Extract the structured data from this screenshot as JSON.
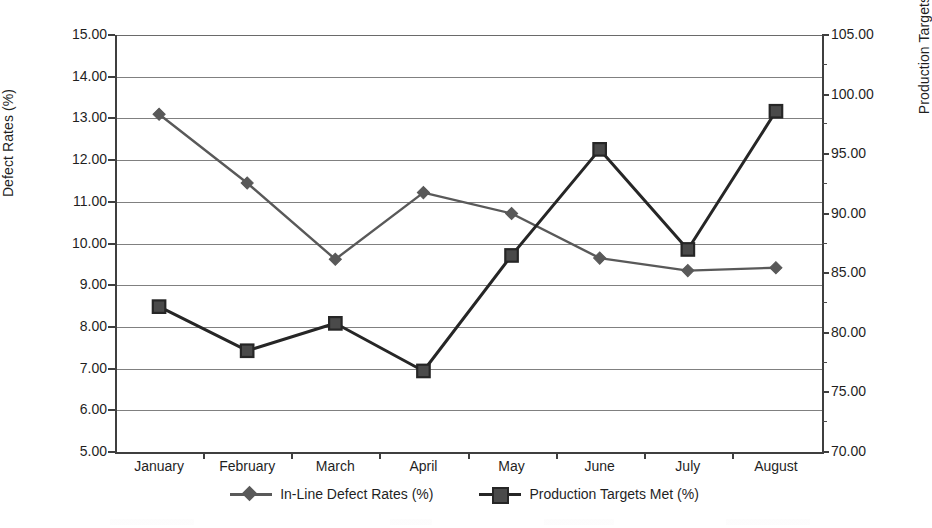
{
  "chart_data": {
    "type": "line",
    "title": "",
    "xlabel": "",
    "categories": [
      "January",
      "February",
      "March",
      "April",
      "May",
      "June",
      "July",
      "August"
    ],
    "grid": true,
    "legend_position": "bottom",
    "series": [
      {
        "name": "In-Line Defect Rates (%)",
        "axis": "left",
        "marker": "diamond",
        "color": "#595959",
        "values": [
          13.1,
          11.45,
          9.62,
          11.22,
          10.72,
          9.65,
          9.35,
          9.42
        ]
      },
      {
        "name": "Production Targets Met (%)",
        "axis": "right",
        "marker": "square",
        "color": "#262626",
        "values": [
          82.2,
          78.5,
          80.8,
          76.8,
          86.5,
          95.4,
          87.0,
          98.6
        ]
      }
    ],
    "axes": {
      "left": {
        "label": "Defect Rates (%)",
        "min": 5.0,
        "max": 15.0,
        "step": 1.0,
        "ticks": [
          "5.00",
          "6.00",
          "7.00",
          "8.00",
          "9.00",
          "10.00",
          "11.00",
          "12.00",
          "13.00",
          "14.00",
          "15.00"
        ]
      },
      "right": {
        "label": "Production Targets (%)",
        "min": 70.0,
        "max": 105.0,
        "step": 2.5,
        "label_step": 5.0,
        "ticks": [
          "70.00",
          "75.00",
          "80.00",
          "85.00",
          "90.00",
          "95.00",
          "100.00",
          "105.00"
        ]
      }
    },
    "legend": [
      {
        "label": "In-Line Defect Rates (%)",
        "marker": "diamond",
        "color": "#595959"
      },
      {
        "label": "Production Targets Met (%)",
        "marker": "square",
        "color": "#262626"
      }
    ]
  }
}
